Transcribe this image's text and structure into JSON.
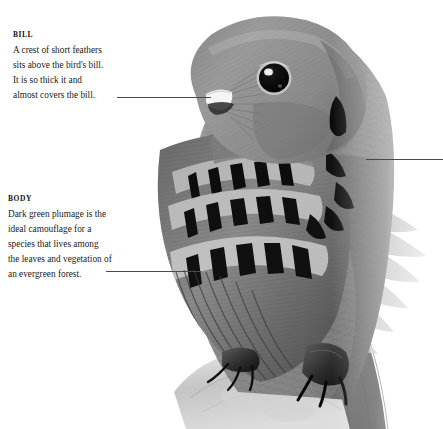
{
  "page": {
    "type": "annotated-natural-history-plate",
    "background_color": "#ffffff",
    "text_color": "#1a1a1a",
    "leader_line_color": "#4a4a4a"
  },
  "callouts": [
    {
      "id": "bill",
      "heading": "BILL",
      "body": "A crest of short feathers\nsits above the bird's bill.\nIt is so thick it and\nalmost covers the bill.",
      "lines": [
        "A crest of short feathers",
        "sits above the bird's bill.",
        "It is so thick it and",
        "almost covers the bill."
      ]
    },
    {
      "id": "body",
      "heading": "BODY",
      "body": "Dark green plumage is the\nideal camouflage for a\nspecies that lives among\nthe leaves and vegetation of\nan evergreen forest.",
      "lines": [
        "Dark green plumage is the",
        "ideal camouflage for a",
        "species that lives among",
        "the leaves and vegetation of",
        "an evergreen forest."
      ]
    }
  ],
  "leaders": {
    "bill_label": "leader line to bill",
    "body_label": "leader line to plumage",
    "right_label": "leader line to right edge"
  },
  "image": {
    "alt": "Grayscale photograph of a crested bird in three-quarter view, perched on a branch",
    "tones": {
      "plumage_mid": "#8d8d8d",
      "plumage_light": "#b9b9b9",
      "plumage_dark": "#5a5a5a",
      "feather_bar": "#161616",
      "eye": "#0a0a0a",
      "bill": "#f2f2f2",
      "branch": "#c9c9c9"
    }
  }
}
